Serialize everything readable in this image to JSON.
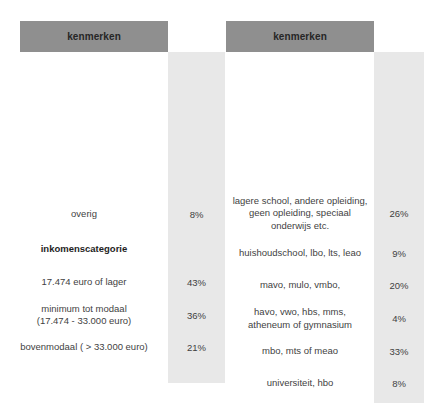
{
  "panels": [
    {
      "name": "left",
      "header": "kenmerken",
      "rows": [
        {
          "label": "overig",
          "value": "8%",
          "section": false
        },
        {
          "label": "inkomenscategorie",
          "value": "",
          "section": true
        },
        {
          "label": "17.474 euro of lager",
          "value": "43%",
          "section": false
        },
        {
          "label": "minimum tot modaal\n(17.474 - 33.000 euro)",
          "value": "36%",
          "section": false
        },
        {
          "label": "bovenmodaal ( > 33.000 euro)",
          "value": "21%",
          "section": false
        }
      ]
    },
    {
      "name": "right",
      "header": "kenmerken",
      "rows": [
        {
          "label": "lagere school, andere opleiding,\ngeen opleiding, speciaal\nonderwijs etc.",
          "value": "26%",
          "section": false
        },
        {
          "label": "huishoudschool, lbo, lts, leao",
          "value": "9%",
          "section": false
        },
        {
          "label": "mavo, mulo, vmbo,",
          "value": "20%",
          "section": false
        },
        {
          "label": "havo, vwo, hbs, mms,\natheneum of gymnasium",
          "value": "4%",
          "section": false
        },
        {
          "label": "mbo, mts of meao",
          "value": "33%",
          "section": false
        },
        {
          "label": "universiteit, hbo",
          "value": "8%",
          "section": false
        }
      ]
    }
  ],
  "colors": {
    "header_band": "#8f8f8f",
    "value_band": "#e8e8e8",
    "text": "#3f3f3f",
    "background": "#ffffff"
  }
}
